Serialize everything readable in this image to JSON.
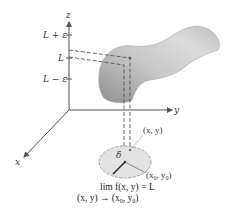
{
  "diagram": {
    "type": "limit-of-function-of-two-variables",
    "axes": {
      "z_label": "z",
      "y_label": "y",
      "x_label": "x"
    },
    "z_ticks": [
      {
        "label": "L + ε"
      },
      {
        "label": "L"
      },
      {
        "label": "L − ε"
      }
    ],
    "point_labels": {
      "xy": "(x, y)",
      "x0y0_prefix": "(x",
      "x0y0_sub0": "0",
      "x0y0_mid": ", y",
      "x0y0_sub1": "0",
      "x0y0_suffix": ")",
      "delta": "δ"
    },
    "formula": {
      "line1": "lim f(x, y) = L",
      "line2_prefix": "(x, y) → (x",
      "line2_sub0": "0",
      "line2_mid": ", y",
      "line2_sub1": "0",
      "line2_suffix": ")"
    },
    "colors": {
      "axis": "#555555",
      "surface_dark": "#8a8a8a",
      "surface_light": "#d9d9d9",
      "disk_fill": "#e3e3e3",
      "disk_stroke": "#8c8c8c",
      "dashed": "#444444"
    }
  }
}
